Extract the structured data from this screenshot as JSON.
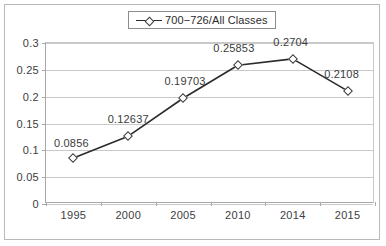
{
  "chart_data": {
    "type": "line",
    "title": "",
    "xlabel": "",
    "ylabel": "",
    "categories": [
      "1995",
      "2000",
      "2005",
      "2010",
      "2014",
      "2015"
    ],
    "series": [
      {
        "name": "700−726/All Classes",
        "values": [
          0.0856,
          0.12637,
          0.19703,
          0.25853,
          0.2704,
          0.2108
        ],
        "labels": [
          "0.0856",
          "0.12637",
          "0.19703",
          "0.25853",
          "0.2704",
          "0.2108"
        ],
        "marker": "open-diamond",
        "line_color": "#2b2b2b"
      }
    ],
    "ylim": [
      0,
      0.3
    ],
    "ytick_step": 0.05,
    "ytick_labels": [
      "0",
      "0.05",
      "0.1",
      "0.15",
      "0.2",
      "0.25",
      "0.3"
    ],
    "ytick_values": [
      0,
      0.05,
      0.1,
      0.15,
      0.2,
      0.25,
      0.3
    ],
    "grid": "horizontal",
    "legend_position": "top-center",
    "colors": {
      "line": "#2b2b2b",
      "grid": "#c9c9c9",
      "axis": "#a8a8a8",
      "text": "#3b3b3b",
      "frame": "#b9b9b9",
      "legend_border": "#8c8c8c",
      "marker_fill": "#ffffff",
      "marker_edge": "#3a3a3a"
    }
  },
  "legend": {
    "entries": [
      {
        "label": "700−726/All Classes"
      }
    ]
  }
}
